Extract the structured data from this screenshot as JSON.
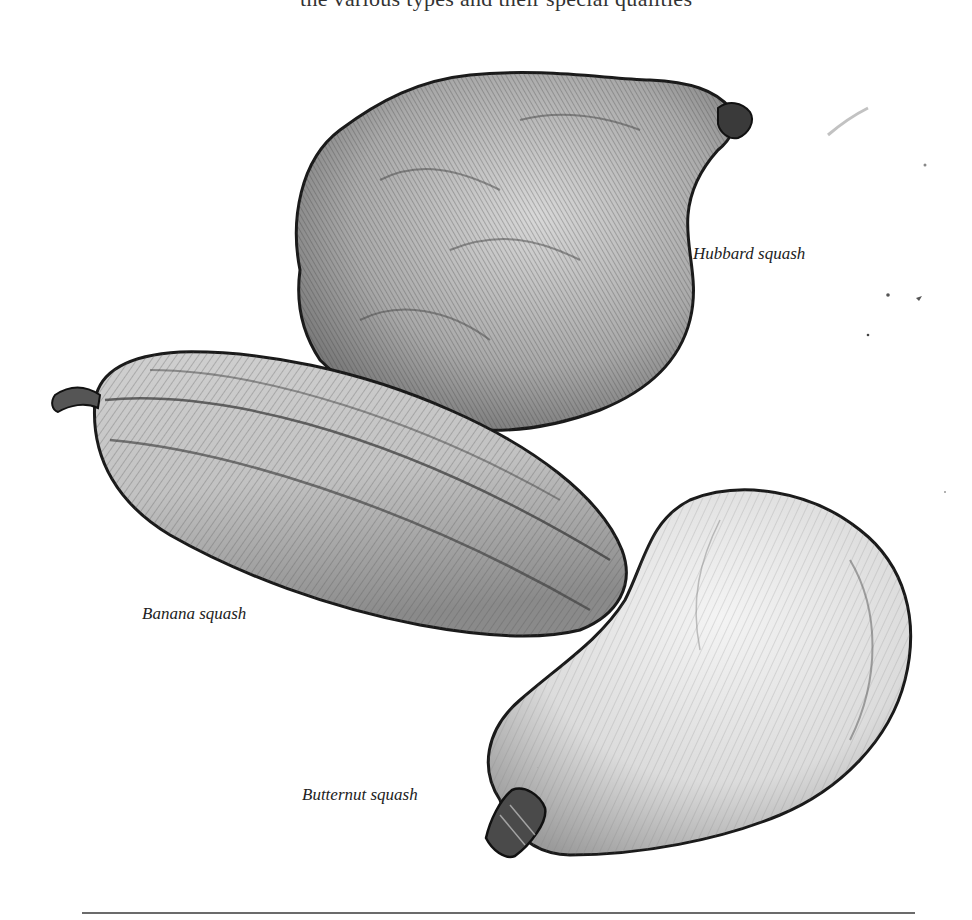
{
  "page": {
    "header_text": "the various types and their special qualities",
    "colors": {
      "background": "#ffffff",
      "ink": "#1a1a1a",
      "rule": "#6b6b6b"
    }
  },
  "figure": {
    "type": "pencil botanical illustration",
    "subjects": [
      {
        "id": "hubbard",
        "label": "Hubbard squash"
      },
      {
        "id": "banana",
        "label": "Banana squash"
      },
      {
        "id": "butternut",
        "label": "Butternut squash"
      }
    ]
  }
}
